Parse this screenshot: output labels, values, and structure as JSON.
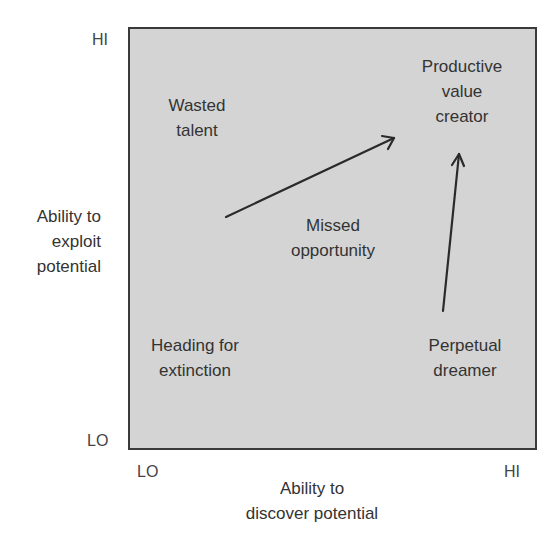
{
  "diagram": {
    "type": "2x2 matrix",
    "y_axis": {
      "title_lines": [
        "Ability to",
        "exploit",
        "potential"
      ],
      "hi_label": "HI",
      "lo_label": "LO"
    },
    "x_axis": {
      "title_lines": [
        "Ability to",
        "discover potential"
      ],
      "lo_label": "LO",
      "hi_label": "HI"
    },
    "quadrants": {
      "top_left": [
        "Wasted",
        "talent"
      ],
      "top_right": [
        "Productive",
        "value",
        "creator"
      ],
      "center": [
        "Missed",
        "opportunity"
      ],
      "bottom_left": [
        "Heading for",
        "extinction"
      ],
      "bottom_right": [
        "Perpetual",
        "dreamer"
      ]
    },
    "arrows": [
      {
        "name": "wasted-to-productive-arrow",
        "from": [
          226,
          217
        ],
        "to": [
          395,
          138
        ]
      },
      {
        "name": "dreamer-to-productive-arrow",
        "from": [
          443,
          311
        ],
        "to": [
          459,
          154
        ]
      }
    ],
    "colors": {
      "box_fill": "#d4d4d4",
      "box_border": "#3a3a3a",
      "text": "#333333",
      "arrow": "#2a2a2a"
    }
  }
}
